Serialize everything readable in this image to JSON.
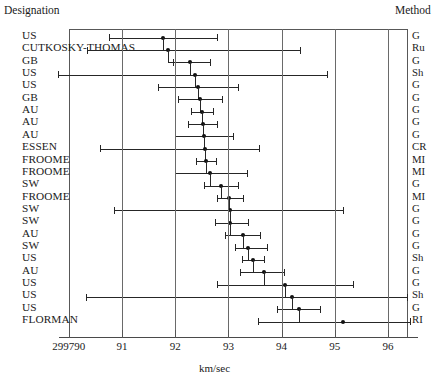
{
  "header": {
    "left_label": "Designation",
    "right_label": "Method"
  },
  "axis": {
    "title": "km/sec",
    "tick_labels": [
      "299790",
      "91",
      "92",
      "93",
      "94",
      "95",
      "96"
    ],
    "tick_values": [
      90,
      91,
      92,
      93,
      94,
      95,
      96
    ],
    "xlim": [
      89.75,
      96.4
    ]
  },
  "chart_data": {
    "type": "error-bar",
    "title": "",
    "xlabel": "km/sec",
    "ylabel": "",
    "xlim": [
      89.75,
      96.4
    ],
    "grid": true,
    "legend": null,
    "note": "Forest plot of speed-of-light determinations; x values are offsets above 299790 km/sec",
    "columns": [
      "Designation",
      "Estimate",
      "Lower",
      "Upper",
      "Method"
    ],
    "rows": [
      {
        "designation": "US",
        "method": "G",
        "estimate": 91.77,
        "lower": 90.76,
        "upper": 92.79
      },
      {
        "designation": "CUTKOSKY-THOMAS",
        "method": "Ru",
        "estimate": 91.87,
        "lower": 90.35,
        "upper": 94.35
      },
      {
        "designation": "GB",
        "method": "G",
        "estimate": 92.28,
        "lower": 91.96,
        "upper": 92.65
      },
      {
        "designation": "US",
        "method": "Sh",
        "estimate": 92.37,
        "lower": 89.8,
        "upper": 94.85
      },
      {
        "designation": "US",
        "method": "G",
        "estimate": 92.43,
        "lower": 91.68,
        "upper": 93.18
      },
      {
        "designation": "GB",
        "method": "G",
        "estimate": 92.47,
        "lower": 92.05,
        "upper": 92.88
      },
      {
        "designation": "AU",
        "method": "G",
        "estimate": 92.5,
        "lower": 92.3,
        "upper": 92.71
      },
      {
        "designation": "AU",
        "method": "G",
        "estimate": 92.52,
        "lower": 92.24,
        "upper": 92.79
      },
      {
        "designation": "AU",
        "method": "G",
        "estimate": 92.54,
        "lower": 92.0,
        "upper": 93.09
      },
      {
        "designation": "ESSEN",
        "method": "CR",
        "estimate": 92.56,
        "lower": 90.58,
        "upper": 93.57
      },
      {
        "designation": "FROOME",
        "method": "MI",
        "estimate": 92.58,
        "lower": 92.39,
        "upper": 92.77
      },
      {
        "designation": "FROOME",
        "method": "MI",
        "estimate": 92.65,
        "lower": 92.0,
        "upper": 93.35
      },
      {
        "designation": "SW",
        "method": "G",
        "estimate": 92.86,
        "lower": 92.54,
        "upper": 93.18
      },
      {
        "designation": "FROOME",
        "method": "MI",
        "estimate": 93.01,
        "lower": 92.79,
        "upper": 93.28
      },
      {
        "designation": "SW",
        "method": "G",
        "estimate": 93.03,
        "lower": 90.85,
        "upper": 95.15
      },
      {
        "designation": "SW",
        "method": "G",
        "estimate": 93.03,
        "lower": 92.75,
        "upper": 93.37
      },
      {
        "designation": "AU",
        "method": "G",
        "estimate": 93.28,
        "lower": 92.94,
        "upper": 93.6
      },
      {
        "designation": "SW",
        "method": "G",
        "estimate": 93.37,
        "lower": 93.13,
        "upper": 93.73
      },
      {
        "designation": "US",
        "method": "Sh",
        "estimate": 93.47,
        "lower": 93.26,
        "upper": 93.67
      },
      {
        "designation": "AU",
        "method": "G",
        "estimate": 93.66,
        "lower": 93.22,
        "upper": 94.05
      },
      {
        "designation": "US",
        "method": "G",
        "estimate": 94.06,
        "lower": 92.79,
        "upper": 95.34
      },
      {
        "designation": "US",
        "method": "Sh",
        "estimate": 94.19,
        "lower": 90.32,
        "upper": 96.36
      },
      {
        "designation": "US",
        "method": "G",
        "estimate": 94.33,
        "lower": 93.91,
        "upper": 94.72
      },
      {
        "designation": "FLORMAN",
        "method": "RI",
        "estimate": 95.15,
        "lower": 93.56,
        "upper": 96.41
      }
    ]
  }
}
